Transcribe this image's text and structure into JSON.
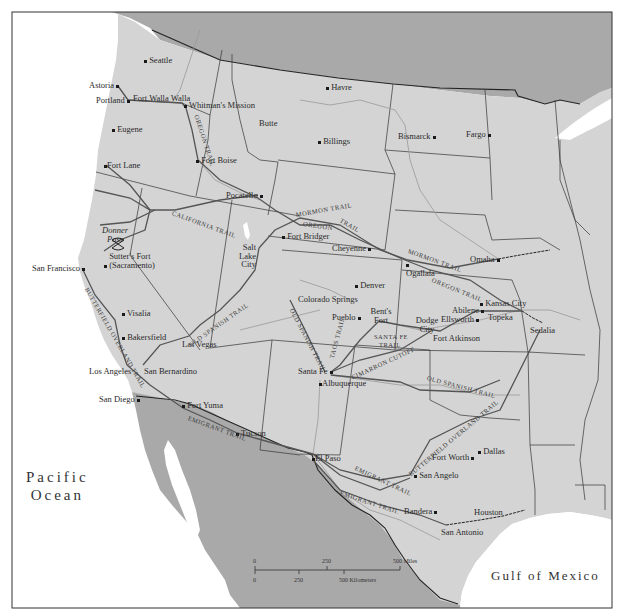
{
  "map": {
    "colors": {
      "background": "#ffffff",
      "us_land": "#d4d4d4",
      "foreign_land": "#a9a9a9",
      "water": "#ffffff",
      "border": "#333333",
      "river": "#999999",
      "trail": "#555555",
      "railroad": "#222222"
    },
    "water_bodies": {
      "pacific": "Pacific Ocean",
      "pacific_line1": "Pacific",
      "pacific_line2": "Ocean",
      "gulf": "Gulf of Mexico"
    },
    "cities": [
      {
        "name": "Seattle",
        "x": 146,
        "y": 58
      },
      {
        "name": "Astoria",
        "x": 117,
        "y": 85
      },
      {
        "name": "Portland",
        "x": 128,
        "y": 100
      },
      {
        "name": "Fort Walla Walla",
        "x": 182,
        "y": 103
      },
      {
        "name": "Whitman's Mission",
        "x": 186,
        "y": 105
      },
      {
        "name": "Eugene",
        "x": 114,
        "y": 129
      },
      {
        "name": "Fort Lane",
        "x": 106,
        "y": 165
      },
      {
        "name": "Fort Boise",
        "x": 198,
        "y": 160
      },
      {
        "name": "Butte",
        "x": 268,
        "y": 128
      },
      {
        "name": "Havre",
        "x": 328,
        "y": 87
      },
      {
        "name": "Billings",
        "x": 320,
        "y": 141
      },
      {
        "name": "Bismarck",
        "x": 433,
        "y": 136
      },
      {
        "name": "Fargo",
        "x": 487,
        "y": 134
      },
      {
        "name": "Pocatello",
        "x": 258,
        "y": 198
      },
      {
        "name": "Donner Pass",
        "x": 118,
        "y": 240
      },
      {
        "name": "Sutter's Fort (Sacramento)",
        "x": 104,
        "y": 251
      },
      {
        "name": "San Francisco",
        "x": 82,
        "y": 268
      },
      {
        "name": "Salt Lake City",
        "x": 259,
        "y": 248
      },
      {
        "name": "Fort Bridger",
        "x": 284,
        "y": 236
      },
      {
        "name": "Cheyenne",
        "x": 362,
        "y": 252
      },
      {
        "name": "Ogallala",
        "x": 408,
        "y": 260
      },
      {
        "name": "Omaha",
        "x": 498,
        "y": 259
      },
      {
        "name": "Denver",
        "x": 357,
        "y": 285
      },
      {
        "name": "Colorado Springs",
        "x": 358,
        "y": 305
      },
      {
        "name": "Pueblo",
        "x": 360,
        "y": 317
      },
      {
        "name": "Bent's Fort",
        "x": 379,
        "y": 321
      },
      {
        "name": "Dodge City",
        "x": 431,
        "y": 331
      },
      {
        "name": "Fort Atkinson",
        "x": 434,
        "y": 333
      },
      {
        "name": "Abilene",
        "x": 476,
        "y": 311
      },
      {
        "name": "Ellsworth",
        "x": 465,
        "y": 321
      },
      {
        "name": "Kansas City",
        "x": 522,
        "y": 311
      },
      {
        "name": "Topeka",
        "x": 505,
        "y": 311
      },
      {
        "name": "Sedalia",
        "x": 543,
        "y": 323
      },
      {
        "name": "Visalia",
        "x": 124,
        "y": 313
      },
      {
        "name": "Bakersfield",
        "x": 124,
        "y": 337
      },
      {
        "name": "Las Vegas",
        "x": 189,
        "y": 336
      },
      {
        "name": "Los Angeles",
        "x": 127,
        "y": 365
      },
      {
        "name": "San Bernardino",
        "x": 143,
        "y": 365
      },
      {
        "name": "San Diego",
        "x": 137,
        "y": 399
      },
      {
        "name": "Fort Yuma",
        "x": 183,
        "y": 408
      },
      {
        "name": "Tucson",
        "x": 237,
        "y": 433
      },
      {
        "name": "Santa Fe",
        "x": 331,
        "y": 372
      },
      {
        "name": "Albuquerque",
        "x": 320,
        "y": 383
      },
      {
        "name": "El Paso",
        "x": 313,
        "y": 454
      },
      {
        "name": "San Angelo",
        "x": 416,
        "y": 475
      },
      {
        "name": "Fort Worth",
        "x": 468,
        "y": 450
      },
      {
        "name": "Dallas",
        "x": 480,
        "y": 451
      },
      {
        "name": "Bandera",
        "x": 430,
        "y": 516
      },
      {
        "name": "Houston",
        "x": 503,
        "y": 516
      },
      {
        "name": "San Antonio",
        "x": 446,
        "y": 525
      }
    ],
    "trails": [
      {
        "name": "Oregon Trail",
        "label": "OREGON TRAIL",
        "segments": 3
      },
      {
        "name": "California Trail",
        "label": "CALIFORNIA TRAIL"
      },
      {
        "name": "Mormon Trail",
        "label": "MORMON TRAIL",
        "segments": 2
      },
      {
        "name": "Old Spanish Trail",
        "label": "OLD SPANISH TRAIL",
        "segments": 3
      },
      {
        "name": "Santa Fe Trail",
        "label": "SANTA FE TRAIL"
      },
      {
        "name": "Taos Trail",
        "label": "TAOS TRAIL"
      },
      {
        "name": "Cimarron Cutoff",
        "label": "CIMARRON CUTOFF"
      },
      {
        "name": "Butterfield Overland Trail",
        "label": "BUTTERFIELD OVERLAND TRAIL",
        "segments": 2
      },
      {
        "name": "Emigrant Trail",
        "label": "EMIGRANT TRAIL",
        "segments": 3
      }
    ],
    "trail_labels": {
      "oregon_1": "OREGON TRAIL",
      "oregon_2a": "OREGON",
      "oregon_2b": "TRAIL",
      "oregon_3": "OREGON TRAIL",
      "california": "CALIFORNIA TRAIL",
      "mormon_1": "MORMON TRAIL",
      "mormon_2": "MORMON TRAIL",
      "old_spanish_1": "OLD SPANISH TRAIL",
      "old_spanish_2": "OLD SPANISH TRAIL",
      "old_spanish_3": "OLD SPANISH TRAIL",
      "santa_fe_a": "SANTA FE",
      "santa_fe_b": "TRAIL",
      "taos": "TAOS TRAIL",
      "cimarron": "CIMARRON CUTOFF",
      "butterfield_1": "BUTTERFIELD OVERLAND TRAIL",
      "butterfield_2": "BUTTERFIELD OVERLAND TRAIL",
      "emigrant_1": "EMIGRANT TRAIL",
      "emigrant_2": "EMIGRANT TRAIL",
      "emigrant_3": "EMIGRANT TRAIL"
    },
    "scale_bar": {
      "miles_ticks": [
        "0",
        "250",
        "500 Miles"
      ],
      "km_ticks": [
        "0",
        "250",
        "500 Kilometers"
      ]
    }
  }
}
